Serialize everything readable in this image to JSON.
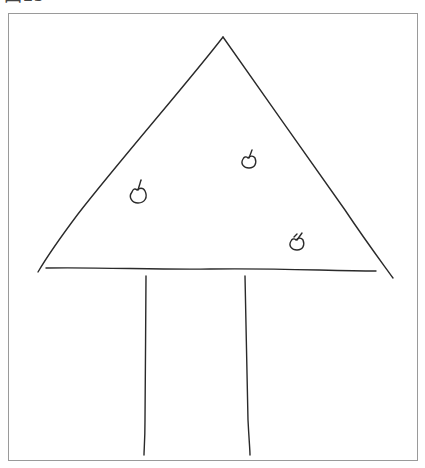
{
  "figure": {
    "label": "図15",
    "label_clipped": true
  },
  "drawing": {
    "subject": "tree drawing",
    "canopy": {
      "shape": "triangle",
      "apex": [
        223,
        37
      ],
      "left_corner": [
        38,
        272
      ],
      "right_corner": [
        393,
        278
      ],
      "base_line": [
        [
          46,
          268
        ],
        [
          376,
          271
        ]
      ]
    },
    "trunk": {
      "left_line": [
        [
          146,
          276
        ],
        [
          144,
          455
        ]
      ],
      "right_line": [
        [
          245,
          276
        ],
        [
          250,
          455
        ]
      ]
    },
    "fruits": [
      {
        "name": "apple-1",
        "cx": 138,
        "cy": 194,
        "r": 7
      },
      {
        "name": "apple-2",
        "cx": 249,
        "cy": 161,
        "r": 6
      },
      {
        "name": "apple-3",
        "cx": 297,
        "cy": 243,
        "r": 6
      }
    ],
    "stroke_color": "#2a2a2a",
    "frame_color": "#9a9a9a"
  }
}
